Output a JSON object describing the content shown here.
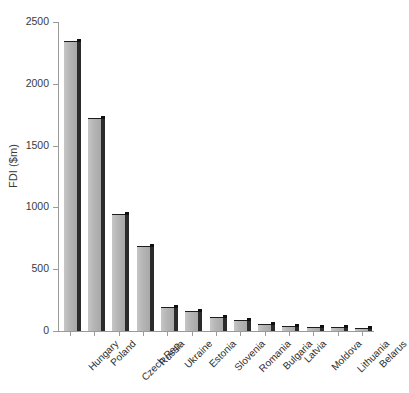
{
  "chart_data": {
    "type": "bar",
    "title": "",
    "xlabel": "",
    "ylabel": "FDI ($m)",
    "ylim": [
      0,
      2500
    ],
    "yticks": [
      0,
      500,
      1000,
      1500,
      2000,
      2500
    ],
    "ytick_labels": [
      "0",
      "500",
      "1000",
      "1500",
      "2000",
      "2500"
    ],
    "grid": false,
    "legend": "none",
    "categories": [
      "Hungary",
      "Poland",
      "Czech Rep.",
      "Russia",
      "Ukraine",
      "Estonia",
      "Slovenia",
      "Romania",
      "Bulgaria",
      "Latvia",
      "Moldova",
      "Lithuania",
      "Belarus"
    ],
    "values": [
      2350,
      1720,
      950,
      690,
      195,
      160,
      110,
      90,
      55,
      40,
      35,
      32,
      28
    ],
    "bar_face_color": "#b5b5b5",
    "bar_edge_color": "#1c1c1c",
    "bar_side_color": "#2b2b2b",
    "axis_color": "#9a9a9a",
    "text_color": "#2e2e2e",
    "background_color": "#ffffff"
  }
}
